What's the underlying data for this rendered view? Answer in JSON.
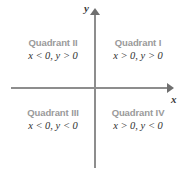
{
  "figure": {
    "type": "coordinate-plane-quadrants",
    "axes": {
      "x_label": "x",
      "y_label": "y",
      "axis_color": "#8d8d8d",
      "arrow_color": "#6f6f6f",
      "origin": {
        "x": 95,
        "y": 88
      }
    },
    "quadrants": [
      {
        "id": "quadrant-1",
        "name": "Quadrant I",
        "condition": "x > 0, y > 0",
        "position": "top-right"
      },
      {
        "id": "quadrant-2",
        "name": "Quadrant II",
        "condition": "x < 0, y > 0",
        "position": "top-left"
      },
      {
        "id": "quadrant-3",
        "name": "Quadrant III",
        "condition": "x < 0, y < 0",
        "position": "bottom-left"
      },
      {
        "id": "quadrant-4",
        "name": "Quadrant IV",
        "condition": "x > 0, y < 0",
        "position": "bottom-right"
      }
    ],
    "colors": {
      "background": "#ffffff",
      "quadrant_name": "#9a9a9a",
      "condition_text": "#303030",
      "axis_label": "#3a3a3a"
    }
  }
}
